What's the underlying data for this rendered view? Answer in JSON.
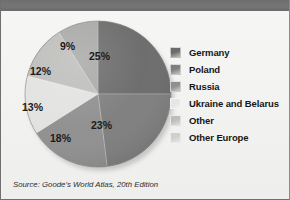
{
  "figure": {
    "title": "",
    "source": "Source: Goode's World Atlas, 20th Edition"
  },
  "colors": {
    "title_bar": "#707070",
    "background": "#f0f0ee",
    "label_text": "#1b1b1b"
  },
  "chart_data": {
    "type": "pie",
    "title": "",
    "categories": [
      "Germany",
      "Poland",
      "Russia",
      "Ukraine and Belarus",
      "Other",
      "Other Europe"
    ],
    "values": [
      25,
      23,
      18,
      13,
      12,
      9
    ],
    "value_labels": [
      "25%",
      "23%",
      "18%",
      "13%",
      "12%",
      "9%"
    ],
    "unit": "%",
    "colors": [
      "#6b6b6b",
      "#7e7e7e",
      "#8f8f8f",
      "#e2e2e0",
      "#bdbdbb",
      "#a8a8a6"
    ],
    "legend_position": "right",
    "start_angle_deg": 0,
    "direction": "clockwise",
    "grid": false,
    "slices": [
      {
        "label": "Germany",
        "value": 25,
        "text": "25%",
        "color": "#6b6b6b",
        "label_x": 97,
        "label_y": 47
      },
      {
        "label": "Poland",
        "value": 23,
        "text": "23%",
        "color": "#7e7e7e",
        "label_x": 99,
        "label_y": 116
      },
      {
        "label": "Russia",
        "value": 18,
        "text": "18%",
        "color": "#8f8f8f",
        "label_x": 58,
        "label_y": 129
      },
      {
        "label": "Ukraine and Belarus",
        "value": 13,
        "text": "13%",
        "color": "#e2e2e0",
        "label_x": 30,
        "label_y": 98
      },
      {
        "label": "Other",
        "value": 12,
        "text": "12%",
        "color": "#bdbdbb",
        "label_x": 38,
        "label_y": 62
      },
      {
        "label": "Other Europe",
        "value": 9,
        "text": "9%",
        "color": "#a8a8a6",
        "label_x": 68,
        "label_y": 37
      }
    ]
  },
  "legend": {
    "items": [
      {
        "label": "Germany",
        "color": "#6b6b6b"
      },
      {
        "label": "Poland",
        "color": "#7e7e7e"
      },
      {
        "label": "Russia",
        "color": "#8f8f8f"
      },
      {
        "label": "Ukraine and Belarus",
        "color": "#e6e6e4"
      },
      {
        "label": "Other",
        "color": "#bdbdbb"
      },
      {
        "label": "Other Europe",
        "color": "#cfcfcd"
      }
    ]
  }
}
